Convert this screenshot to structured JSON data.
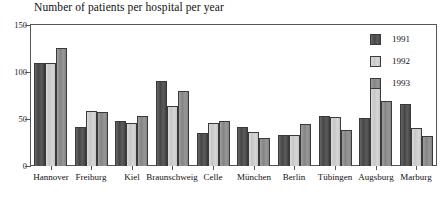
{
  "chart_data": {
    "type": "bar",
    "title": "Number of patients per hospital per year",
    "xlabel": "",
    "ylabel": "",
    "ylim": [
      0,
      150
    ],
    "yticks": [
      0,
      50,
      100,
      150
    ],
    "grid": false,
    "legend_position": "top-right",
    "categories": [
      "Hannover",
      "Freiburg",
      "Kiel",
      "Braunschweig",
      "Celle",
      "München",
      "Berlin",
      "Tübingen",
      "Augsburg",
      "Marburg"
    ],
    "series": [
      {
        "name": "1991",
        "color": "#4a4a4a",
        "values": [
          110,
          41,
          48,
          90,
          35,
          41,
          33,
          53,
          51,
          66
        ]
      },
      {
        "name": "1992",
        "color": "#d2d2d2",
        "values": [
          110,
          58,
          46,
          64,
          46,
          36,
          33,
          52,
          89,
          40
        ]
      },
      {
        "name": "1993",
        "color": "#8c8c8c",
        "values": [
          126,
          57,
          53,
          80,
          48,
          30,
          45,
          38,
          69,
          32
        ]
      }
    ]
  },
  "axis": {
    "y_tick_labels": [
      "150",
      "100",
      "50",
      "0"
    ]
  },
  "legend": {
    "entries": [
      {
        "label": "1991",
        "swatch": "legend-swatch-1991"
      },
      {
        "label": "1992",
        "swatch": "legend-swatch-1992"
      },
      {
        "label": "1993",
        "swatch": "legend-swatch-1993"
      }
    ]
  }
}
